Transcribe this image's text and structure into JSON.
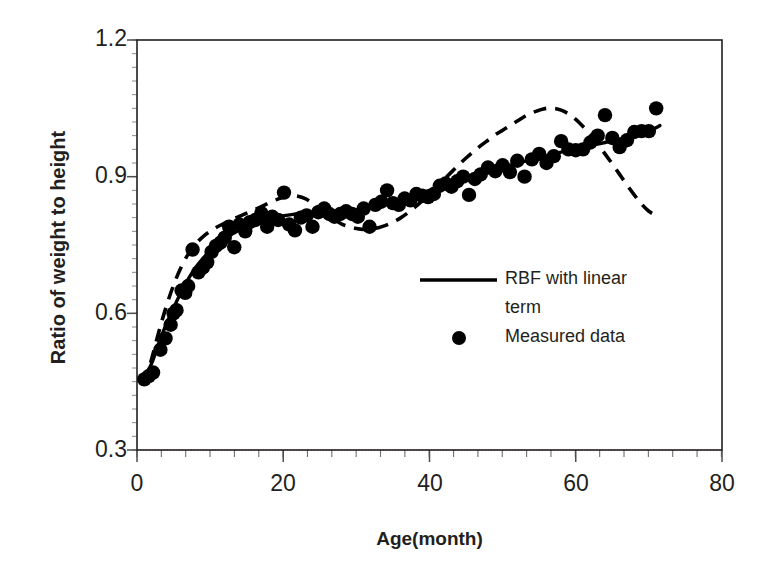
{
  "chart_data": {
    "type": "scatter",
    "title": "",
    "xlabel": "Age(month)",
    "ylabel": "Ratio of weight to height",
    "xlim": [
      0,
      80
    ],
    "ylim": [
      0.3,
      1.2
    ],
    "xticks": [
      0,
      20,
      40,
      60,
      80
    ],
    "yticks": [
      0.3,
      0.6,
      0.9,
      1.2
    ],
    "xtick_labels": [
      "0",
      "20",
      "40",
      "60",
      "80"
    ],
    "ytick_labels": [
      "0.3",
      "0.6",
      "0.9",
      "1.2"
    ],
    "x_minor_tick_step": 3.33,
    "y_minor_tick_step": 0.03,
    "grid": false,
    "legend_position": "inside-lower-right",
    "legend": [
      {
        "label": "RBF with linear term",
        "marker": "line",
        "color": "#000000"
      },
      {
        "label": "Measured data",
        "marker": "dot",
        "color": "#000000"
      }
    ],
    "series": [
      {
        "name": "Measured data",
        "type": "scatter",
        "color": "#000000",
        "points": [
          [
            1.0,
            0.455
          ],
          [
            1.6,
            0.462
          ],
          [
            2.2,
            0.47
          ],
          [
            3.2,
            0.52
          ],
          [
            3.9,
            0.545
          ],
          [
            4.6,
            0.575
          ],
          [
            5.0,
            0.6
          ],
          [
            5.4,
            0.607
          ],
          [
            6.1,
            0.65
          ],
          [
            6.6,
            0.645
          ],
          [
            7.0,
            0.66
          ],
          [
            7.6,
            0.74
          ],
          [
            8.4,
            0.69
          ],
          [
            9.0,
            0.7
          ],
          [
            9.6,
            0.712
          ],
          [
            10.2,
            0.735
          ],
          [
            10.8,
            0.748
          ],
          [
            11.4,
            0.755
          ],
          [
            12.0,
            0.766
          ],
          [
            12.6,
            0.79
          ],
          [
            13.3,
            0.745
          ],
          [
            14.0,
            0.795
          ],
          [
            14.8,
            0.78
          ],
          [
            15.4,
            0.8
          ],
          [
            16.2,
            0.805
          ],
          [
            17.0,
            0.82
          ],
          [
            17.8,
            0.79
          ],
          [
            18.5,
            0.812
          ],
          [
            19.3,
            0.805
          ],
          [
            20.1,
            0.865
          ],
          [
            20.8,
            0.795
          ],
          [
            21.6,
            0.782
          ],
          [
            22.4,
            0.81
          ],
          [
            23.2,
            0.815
          ],
          [
            24.0,
            0.79
          ],
          [
            24.8,
            0.822
          ],
          [
            25.6,
            0.83
          ],
          [
            26.3,
            0.818
          ],
          [
            27.0,
            0.812
          ],
          [
            27.8,
            0.818
          ],
          [
            28.6,
            0.824
          ],
          [
            29.4,
            0.818
          ],
          [
            30.2,
            0.812
          ],
          [
            31.0,
            0.83
          ],
          [
            31.8,
            0.79
          ],
          [
            32.6,
            0.838
          ],
          [
            33.4,
            0.845
          ],
          [
            34.2,
            0.87
          ],
          [
            35.0,
            0.842
          ],
          [
            35.8,
            0.838
          ],
          [
            36.6,
            0.852
          ],
          [
            37.4,
            0.848
          ],
          [
            38.2,
            0.862
          ],
          [
            39.0,
            0.858
          ],
          [
            39.8,
            0.855
          ],
          [
            40.6,
            0.862
          ],
          [
            41.4,
            0.88
          ],
          [
            42.2,
            0.885
          ],
          [
            43.0,
            0.878
          ],
          [
            43.8,
            0.89
          ],
          [
            44.6,
            0.9
          ],
          [
            45.4,
            0.86
          ],
          [
            46.2,
            0.895
          ],
          [
            47.0,
            0.905
          ],
          [
            48.0,
            0.92
          ],
          [
            49.0,
            0.912
          ],
          [
            50.0,
            0.925
          ],
          [
            51.0,
            0.91
          ],
          [
            52.0,
            0.935
          ],
          [
            53.0,
            0.9
          ],
          [
            54.0,
            0.938
          ],
          [
            55.0,
            0.95
          ],
          [
            56.0,
            0.93
          ],
          [
            57.0,
            0.945
          ],
          [
            58.0,
            0.978
          ],
          [
            59.0,
            0.96
          ],
          [
            60.0,
            0.958
          ],
          [
            61.0,
            0.96
          ],
          [
            62.0,
            0.975
          ],
          [
            63.0,
            0.99
          ],
          [
            64.0,
            1.035
          ],
          [
            65.0,
            0.985
          ],
          [
            66.0,
            0.965
          ],
          [
            67.0,
            0.98
          ],
          [
            68.0,
            0.998
          ],
          [
            69.0,
            1.0
          ],
          [
            70.0,
            1.0
          ],
          [
            71.0,
            1.05
          ]
        ]
      },
      {
        "name": "RBF with linear term",
        "type": "line",
        "style": "solid",
        "color": "#000000",
        "points": [
          [
            1.0,
            0.458
          ],
          [
            2.0,
            0.49
          ],
          [
            3.0,
            0.535
          ],
          [
            4.0,
            0.576
          ],
          [
            5.0,
            0.612
          ],
          [
            6.0,
            0.645
          ],
          [
            7.0,
            0.675
          ],
          [
            8.0,
            0.7
          ],
          [
            9.0,
            0.72
          ],
          [
            10.0,
            0.738
          ],
          [
            11.0,
            0.752
          ],
          [
            12.0,
            0.764
          ],
          [
            13.0,
            0.774
          ],
          [
            14.0,
            0.783
          ],
          [
            15.0,
            0.79
          ],
          [
            16.0,
            0.797
          ],
          [
            17.0,
            0.802
          ],
          [
            18.0,
            0.807
          ],
          [
            19.0,
            0.811
          ],
          [
            20.0,
            0.814
          ],
          [
            22.0,
            0.819
          ],
          [
            24.0,
            0.821
          ],
          [
            26.0,
            0.822
          ],
          [
            28.0,
            0.823
          ],
          [
            30.0,
            0.827
          ],
          [
            32.0,
            0.834
          ],
          [
            34.0,
            0.843
          ],
          [
            36.0,
            0.852
          ],
          [
            38.0,
            0.861
          ],
          [
            40.0,
            0.87
          ],
          [
            42.0,
            0.88
          ],
          [
            44.0,
            0.89
          ],
          [
            46.0,
            0.9
          ],
          [
            48.0,
            0.91
          ],
          [
            50.0,
            0.92
          ],
          [
            52.0,
            0.929
          ],
          [
            54.0,
            0.938
          ],
          [
            56.0,
            0.946
          ],
          [
            58.0,
            0.954
          ],
          [
            60.0,
            0.961
          ],
          [
            62.0,
            0.968
          ],
          [
            64.0,
            0.975
          ],
          [
            66.0,
            0.982
          ],
          [
            68.0,
            0.99
          ],
          [
            70.0,
            1.0
          ],
          [
            71.5,
            1.012
          ]
        ]
      },
      {
        "name": "RBF without linear term",
        "type": "line",
        "style": "dashed",
        "color": "#000000",
        "points": [
          [
            1.0,
            0.445
          ],
          [
            2.0,
            0.5
          ],
          [
            3.0,
            0.56
          ],
          [
            4.0,
            0.615
          ],
          [
            5.0,
            0.662
          ],
          [
            6.0,
            0.7
          ],
          [
            7.0,
            0.73
          ],
          [
            8.0,
            0.752
          ],
          [
            9.0,
            0.768
          ],
          [
            10.0,
            0.78
          ],
          [
            11.0,
            0.79
          ],
          [
            12.0,
            0.798
          ],
          [
            13.0,
            0.806
          ],
          [
            14.0,
            0.813
          ],
          [
            15.0,
            0.82
          ],
          [
            16.0,
            0.827
          ],
          [
            17.0,
            0.834
          ],
          [
            18.0,
            0.842
          ],
          [
            19.0,
            0.849
          ],
          [
            20.0,
            0.855
          ],
          [
            21.0,
            0.858
          ],
          [
            22.0,
            0.857
          ],
          [
            23.0,
            0.852
          ],
          [
            24.0,
            0.842
          ],
          [
            25.0,
            0.83
          ],
          [
            26.0,
            0.818
          ],
          [
            27.0,
            0.806
          ],
          [
            28.0,
            0.796
          ],
          [
            29.0,
            0.79
          ],
          [
            30.0,
            0.786
          ],
          [
            31.0,
            0.784
          ],
          [
            32.0,
            0.785
          ],
          [
            33.0,
            0.788
          ],
          [
            34.0,
            0.793
          ],
          [
            35.0,
            0.8
          ],
          [
            36.0,
            0.809
          ],
          [
            37.0,
            0.82
          ],
          [
            38.0,
            0.833
          ],
          [
            39.0,
            0.847
          ],
          [
            40.0,
            0.862
          ],
          [
            41.0,
            0.878
          ],
          [
            42.0,
            0.894
          ],
          [
            43.0,
            0.91
          ],
          [
            44.0,
            0.926
          ],
          [
            45.0,
            0.941
          ],
          [
            46.0,
            0.955
          ],
          [
            47.0,
            0.968
          ],
          [
            48.0,
            0.98
          ],
          [
            49.0,
            0.992
          ],
          [
            50.0,
            1.002
          ],
          [
            51.0,
            1.012
          ],
          [
            52.0,
            1.022
          ],
          [
            53.0,
            1.032
          ],
          [
            54.0,
            1.04
          ],
          [
            55.0,
            1.046
          ],
          [
            56.0,
            1.05
          ],
          [
            57.0,
            1.05
          ],
          [
            58.0,
            1.046
          ],
          [
            59.0,
            1.038
          ],
          [
            60.0,
            1.026
          ],
          [
            61.0,
            1.01
          ],
          [
            62.0,
            0.992
          ],
          [
            63.0,
            0.972
          ],
          [
            64.0,
            0.95
          ],
          [
            65.0,
            0.928
          ],
          [
            66.0,
            0.905
          ],
          [
            67.0,
            0.882
          ],
          [
            68.0,
            0.86
          ],
          [
            69.0,
            0.84
          ],
          [
            70.0,
            0.824
          ],
          [
            71.0,
            0.815
          ]
        ]
      }
    ]
  }
}
